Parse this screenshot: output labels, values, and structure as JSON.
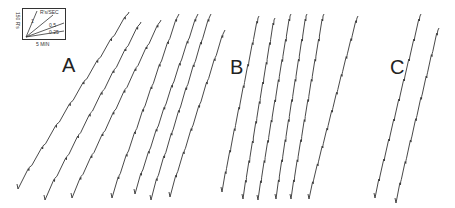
{
  "figure": {
    "panels": [
      {
        "id": "A",
        "label": "A"
      },
      {
        "id": "B",
        "label": "B"
      },
      {
        "id": "C",
        "label": "C"
      }
    ],
    "legend": {
      "y_scale": "150 R's",
      "x_scale": "5 MIN",
      "rate_unit": "R's/SEC",
      "rates": [
        "1",
        "0.5",
        "0.25"
      ]
    },
    "stroke_color": "#333333"
  },
  "chart_data": {
    "type": "line",
    "title": "",
    "xlabel": "Time (scale bar: 5 MIN)",
    "ylabel": "Cumulative responses (scale bar: 150 R's)",
    "legend": {
      "rate_unit": "R's/SEC",
      "slopes": [
        "1",
        "0.5",
        "0.25"
      ]
    },
    "panels": [
      {
        "label": "A",
        "series": [
          {
            "start": [
              18,
              187
            ],
            "end": [
              128,
              14
            ],
            "steps": 8
          },
          {
            "start": [
              45,
              198
            ],
            "end": [
              140,
              24
            ],
            "steps": 8
          },
          {
            "start": [
              72,
              196
            ],
            "end": [
              160,
              22
            ],
            "steps": 8
          },
          {
            "start": [
              112,
              196
            ],
            "end": [
              178,
              16
            ],
            "steps": 8
          },
          {
            "start": [
              135,
              192
            ],
            "end": [
              197,
              16
            ],
            "steps": 8
          },
          {
            "start": [
              151,
              198
            ],
            "end": [
              210,
              16
            ],
            "steps": 8
          },
          {
            "start": [
              170,
              195
            ],
            "end": [
              224,
              32
            ],
            "steps": 7
          }
        ]
      },
      {
        "label": "B",
        "series": [
          {
            "start": [
              222,
              190
            ],
            "end": [
              258,
              18
            ],
            "steps": 8
          },
          {
            "start": [
              243,
              197
            ],
            "end": [
              274,
              20
            ],
            "steps": 9
          },
          {
            "start": [
              258,
              198
            ],
            "end": [
              290,
              16
            ],
            "steps": 9
          },
          {
            "start": [
              276,
              197
            ],
            "end": [
              306,
              16
            ],
            "steps": 9
          },
          {
            "start": [
              291,
              197
            ],
            "end": [
              323,
              16
            ],
            "steps": 9
          },
          {
            "start": [
              309,
              197
            ],
            "end": [
              357,
              18
            ],
            "steps": 10
          }
        ]
      },
      {
        "label": "C",
        "series": [
          {
            "start": [
              375,
              196
            ],
            "end": [
              420,
              16
            ],
            "steps": 9
          },
          {
            "start": [
              396,
              201
            ],
            "end": [
              438,
              30
            ],
            "steps": 8
          }
        ]
      }
    ]
  }
}
